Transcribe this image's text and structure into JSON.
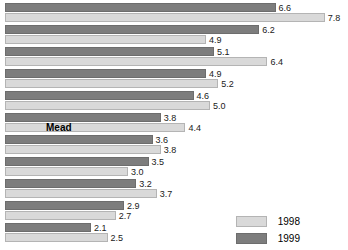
{
  "chart_data": {
    "type": "bar",
    "orientation": "horizontal",
    "title": "",
    "xlabel": "",
    "ylabel": "",
    "grid": false,
    "legend_position": "bottom-right",
    "xlim": [
      0,
      8.0
    ],
    "categories": [
      "",
      "",
      "",
      "",
      "",
      "Mead",
      "",
      "",
      "",
      "",
      ""
    ],
    "series": [
      {
        "name": "1998",
        "color": "#d9d9d9",
        "values": [
          7.8,
          4.9,
          6.4,
          5.2,
          5.0,
          4.4,
          3.8,
          3.0,
          3.7,
          2.7,
          2.5
        ]
      },
      {
        "name": "1999",
        "color": "#7d7d7d",
        "values": [
          6.6,
          6.2,
          5.1,
          4.9,
          4.6,
          3.8,
          3.6,
          3.5,
          3.2,
          2.9,
          2.1
        ]
      }
    ],
    "value_labels": {
      "1998": [
        "7.8",
        "4.9",
        "6.4",
        "5.2",
        "5.0",
        "4.4",
        "3.8",
        "3.0",
        "3.7",
        "2.7",
        "2.5"
      ],
      "1999": [
        "6.6",
        "6.2",
        "5.1",
        "4.9",
        "4.6",
        "3.8",
        "3.6",
        "3.5",
        "3.2",
        "2.9",
        "2.1"
      ]
    },
    "annotations": [
      {
        "text": "Mead",
        "row": 5,
        "series": "1998",
        "style": "bold-overlay"
      }
    ]
  },
  "legend": {
    "items": [
      {
        "label": "1998",
        "color": "#d9d9d9"
      },
      {
        "label": "1999",
        "color": "#7d7d7d"
      }
    ]
  }
}
